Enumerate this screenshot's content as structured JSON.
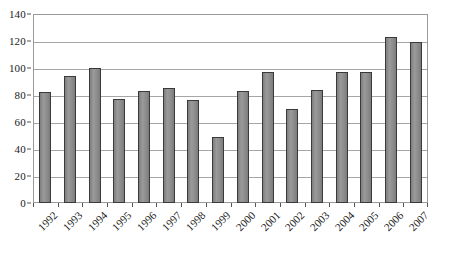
{
  "chart_data": {
    "type": "bar",
    "title": "",
    "xlabel": "",
    "ylabel": "",
    "categories": [
      "1992",
      "1993",
      "1994",
      "1995",
      "1996",
      "1997",
      "1998",
      "1999",
      "2000",
      "2001",
      "2002",
      "2003",
      "2004",
      "2005",
      "2006",
      "2007"
    ],
    "values": [
      82,
      94,
      100,
      77,
      83,
      85,
      76,
      49,
      83,
      97,
      70,
      84,
      97,
      97,
      123,
      119
    ],
    "ylim": [
      0,
      140
    ],
    "ytick_step": 20,
    "yticks": [
      0,
      20,
      40,
      60,
      80,
      100,
      120,
      140
    ],
    "ytick_labels": [
      "0",
      "20",
      "40",
      "60",
      "80",
      "100",
      "120",
      "140"
    ],
    "grid": true,
    "grid_axis": "y",
    "legend": false,
    "legend_position": "none",
    "series": [
      {
        "name": "",
        "values": [
          82,
          94,
          100,
          77,
          83,
          85,
          76,
          49,
          83,
          97,
          70,
          84,
          97,
          97,
          123,
          119
        ]
      }
    ],
    "bar_color": "#8c8c8c",
    "bar_edge_color": "#3a3a3a",
    "grid_color": "#a6a6a6",
    "frame_color": "#9a9a9a",
    "axis_text_color": "#1a1a1a",
    "background_color": "#ffffff",
    "xtick_rotation": -45
  }
}
